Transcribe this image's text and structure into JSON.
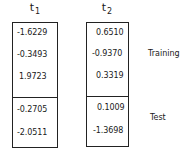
{
  "columns": [
    {
      "header": "t",
      "subscript": "1",
      "training": [
        "-1.6229",
        "-0.3493",
        "1.9723"
      ],
      "test": [
        "-0.2705",
        "-2.0511"
      ]
    },
    {
      "header": "t",
      "subscript": "2",
      "training": [
        "0.6510",
        "-0.9370",
        "0.3319"
      ],
      "test": [
        "0.1009",
        "-1.3698"
      ]
    }
  ],
  "labels": {
    "training": "Training",
    "test": "Test"
  }
}
